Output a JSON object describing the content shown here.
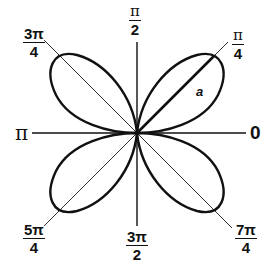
{
  "diagram": {
    "curve": "rose",
    "petals": 4,
    "petal_directions": [
      "π/4",
      "3π/4",
      "5π/4",
      "7π/4"
    ],
    "radius_label": "a",
    "line_color": "#111111",
    "labels": {
      "angle_0": "0",
      "angle_pi": "π",
      "angle_pi_over_2": {
        "num": "π",
        "den": "2"
      },
      "angle_pi_over_4": {
        "num": "π",
        "den": "4"
      },
      "angle_3pi_over_4": {
        "num": "3π",
        "den": "4"
      },
      "angle_5pi_over_4": {
        "num": "5π",
        "den": "4"
      },
      "angle_3pi_over_2": {
        "num": "3π",
        "den": "2"
      },
      "angle_7pi_over_4": {
        "num": "7π",
        "den": "4"
      }
    }
  }
}
